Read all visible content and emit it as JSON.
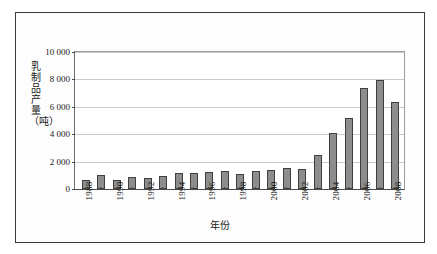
{
  "chart_data": {
    "type": "bar",
    "title": "",
    "xlabel": "年份",
    "ylabel": "乳制品产量（吨）",
    "ylim": [
      0,
      10000
    ],
    "yticks": [
      0,
      2000,
      4000,
      6000,
      8000,
      10000
    ],
    "ytick_labels": [
      "0",
      "2 000",
      "4 000",
      "6 000",
      "8 000",
      "10 000"
    ],
    "grid": true,
    "legend": null,
    "categories": [
      "1988",
      "1989",
      "1990",
      "1991",
      "1992",
      "1993",
      "1994",
      "1995",
      "1996",
      "1997",
      "1998",
      "1999",
      "2000",
      "2001",
      "2002",
      "2003",
      "2004",
      "2005",
      "2006",
      "2007",
      "2008"
    ],
    "xtick_labels_shown": [
      "1988",
      "",
      "1990",
      "",
      "1992",
      "",
      "1994",
      "",
      "1996",
      "",
      "1998",
      "",
      "2000",
      "",
      "2002",
      "",
      "2004",
      "",
      "2006",
      "",
      "2008"
    ],
    "values": [
      650,
      1000,
      680,
      870,
      820,
      980,
      1150,
      1170,
      1250,
      1300,
      1090,
      1300,
      1400,
      1500,
      1460,
      2480,
      4120,
      5150,
      7340,
      7960,
      6380
    ],
    "series": [
      {
        "name": "乳制品产量",
        "color": "#8d8d8d",
        "values": [
          650,
          1000,
          680,
          870,
          820,
          980,
          1150,
          1170,
          1250,
          1300,
          1090,
          1300,
          1400,
          1500,
          1460,
          2480,
          4120,
          5150,
          7340,
          7960,
          6380
        ]
      }
    ]
  },
  "figure": {
    "border_color": "#3a3a3a",
    "background": "#ffffff",
    "grid_color": "#c9c9c9",
    "axis_color": "#4a4a4a"
  }
}
